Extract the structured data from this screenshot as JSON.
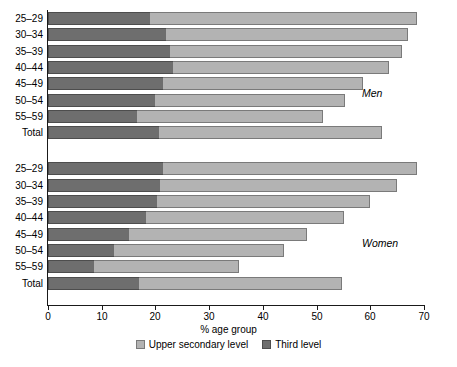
{
  "chart_data": {
    "type": "bar",
    "subtype": "stacked-horizontal",
    "title": "",
    "xlabel": "% age group",
    "ylabel": "",
    "xlim": [
      0,
      70
    ],
    "xticks": [
      0,
      10,
      20,
      30,
      40,
      50,
      60,
      70
    ],
    "grid": false,
    "legend_position": "bottom",
    "series": [
      {
        "name": "Upper secondary level",
        "color": "#b3b3b3"
      },
      {
        "name": "Third level",
        "color": "#6e6e6e"
      }
    ],
    "groups": [
      {
        "name": "Men",
        "categories": [
          "25–29",
          "30–34",
          "35–39",
          "40–44",
          "45–49",
          "50–54",
          "55–59",
          "Total"
        ],
        "third_level": [
          19.0,
          22.0,
          22.7,
          23.2,
          21.4,
          20.0,
          16.6,
          20.7
        ],
        "upper_secondary": [
          49.7,
          45.0,
          43.3,
          40.3,
          37.2,
          35.4,
          34.6,
          41.5
        ],
        "totals": [
          68.7,
          67.0,
          66.0,
          63.5,
          58.6,
          55.4,
          51.2,
          62.2
        ]
      },
      {
        "name": "Women",
        "categories": [
          "25–29",
          "30–34",
          "35–39",
          "40–44",
          "45–49",
          "50–54",
          "55–59",
          "Total"
        ],
        "third_level": [
          21.4,
          20.8,
          20.3,
          18.2,
          15.1,
          12.2,
          8.5,
          17.0
        ],
        "upper_secondary": [
          47.4,
          44.1,
          39.6,
          37.0,
          33.1,
          31.7,
          27.0,
          37.7
        ],
        "totals": [
          68.8,
          64.9,
          59.9,
          55.2,
          48.2,
          43.9,
          35.5,
          54.7
        ]
      }
    ]
  },
  "axis": {
    "x_title": "% age group",
    "tick_labels": [
      "0",
      "10",
      "20",
      "30",
      "40",
      "50",
      "60",
      "70"
    ]
  },
  "legend": {
    "items": [
      {
        "label": "Upper secondary level",
        "swatch": "light-gray-swatch"
      },
      {
        "label": "Third level",
        "swatch": "dark-gray-swatch"
      }
    ]
  },
  "annotations": {
    "men": "Men",
    "women": "Women"
  },
  "colors": {
    "third_level": "#6e6e6e",
    "upper_secondary": "#b3b3b3",
    "axis": "#1a1a1a",
    "background": "#ffffff"
  }
}
